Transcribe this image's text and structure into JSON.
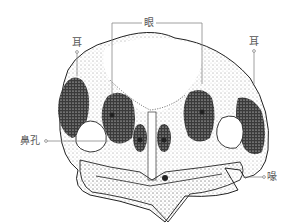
{
  "figure": {
    "labels": {
      "eye": "眼",
      "ear_left": "耳",
      "ear_right": "耳",
      "nostril": "鼻孔",
      "beak": "喙"
    },
    "colors": {
      "ink": "#222222",
      "leader_line": "#888888",
      "label_text": "#555555",
      "background": "#ffffff"
    }
  }
}
